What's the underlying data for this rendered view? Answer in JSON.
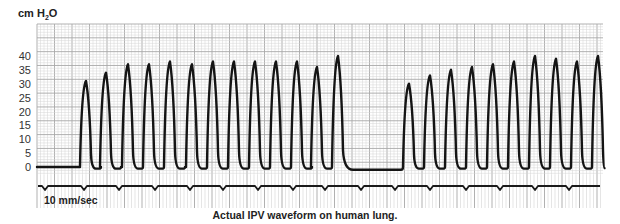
{
  "chart_data": {
    "type": "line",
    "title": "Actual IPV waveform on human lung.",
    "ylabel": "cm H2O",
    "ylabel_main": "cm H",
    "ylabel_sub": "2",
    "ylabel_tail": "O",
    "xlabel": "",
    "annotation": "10 mm/sec",
    "yticks": [
      0,
      5,
      10,
      15,
      20,
      25,
      30,
      35,
      40
    ],
    "ylim": [
      -2,
      46
    ],
    "grid": true,
    "legend": "none",
    "series": [
      {
        "name": "Airway pressure",
        "bursts": [
          {
            "label": "burst-1",
            "peaks": [
              31,
              34,
              37,
              37,
              38,
              37,
              38,
              38,
              38,
              38,
              38,
              36,
              40
            ],
            "peak_x": [
              86,
              106,
              128,
              149,
              170,
              192,
              213,
              234,
              255,
              276,
              297,
              317,
              338
            ]
          },
          {
            "label": "burst-2",
            "peaks": [
              30,
              33,
              35,
              36,
              37,
              38,
              40,
              39,
              38,
              40
            ],
            "peak_x": [
              409,
              430,
              451,
              472,
              493,
              514,
              535,
              556,
              577,
              598
            ]
          }
        ],
        "baseline_before": 0,
        "pause_level": -1
      }
    ],
    "timing_marks_x": [
      45,
      84,
      119,
      155,
      190,
      223,
      258,
      293,
      325,
      361,
      395,
      430,
      466,
      500,
      535,
      569
    ]
  },
  "labels": {
    "y_axis_title_main": "cm H",
    "y_axis_title_sub": "2",
    "y_axis_title_tail": "O",
    "speed": "10 mm/sec",
    "caption": "Actual IPV waveform on human lung."
  },
  "colors": {
    "grid_minor": "#d4d4d4",
    "grid_major": "#a8a8a8",
    "trace": "#141414",
    "text": "#222222"
  }
}
